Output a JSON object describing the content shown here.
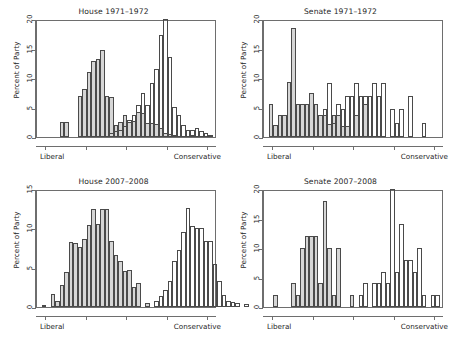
{
  "figure": {
    "background": "#ffffff",
    "dem_color": "#d6d6d6",
    "rep_color": "#ffffff",
    "border_color": "#4a4a4a",
    "axis_color": "#6e6e6e"
  },
  "axis_labels": {
    "y": "Percent of Party",
    "x_left": "Liberal",
    "x_right": "Conservative"
  },
  "chart_data": [
    {
      "id": "house-1971-1972",
      "type": "bar",
      "title": "House 1971–1972",
      "xlabel": "",
      "ylabel": "Percent of Party",
      "xlim": [
        0,
        40
      ],
      "ylim": [
        0,
        20
      ],
      "yticks": [
        0,
        5,
        10,
        15,
        20
      ],
      "ytick_labels": [
        "0",
        "5",
        "10",
        "15",
        "20"
      ],
      "xticks": [
        2,
        11,
        20,
        29,
        38
      ],
      "grid": false,
      "legend": "none",
      "note": "Overlapping histograms of ideology scores; gray = liberal party, white = conservative party",
      "series": [
        {
          "name": "Liberal party (gray)",
          "fill": "#d6d6d6",
          "bin_start": 5,
          "bin_width": 1,
          "values": [
            2.6,
            2.6,
            0,
            0,
            7.0,
            8.1,
            11.0,
            12.8,
            13.2,
            14.8,
            7.0,
            6.8,
            2.0,
            2.5,
            3.7,
            2.6,
            2.7,
            4.3,
            4.0,
            2.4,
            2.3,
            2.2,
            1.6,
            0.6,
            0.5,
            0.3,
            0,
            0,
            0,
            0.2
          ]
        },
        {
          "name": "Conservative party (white)",
          "fill": "#ffffff",
          "bin_start": 16,
          "bin_width": 1,
          "values": [
            0.6,
            1.0,
            1.2,
            1.9,
            2.9,
            3.8,
            5.4,
            7.4,
            5.4,
            9.2,
            11.6,
            17.3,
            20.0,
            13.6,
            5.1,
            3.8,
            2.0,
            1.2,
            1.2,
            1.5,
            1.1,
            0.7,
            0.3
          ]
        }
      ]
    },
    {
      "id": "senate-1971-1972",
      "type": "bar",
      "title": "Senate 1971–1972",
      "xlabel": "",
      "ylabel": "Percent of Party",
      "xlim": [
        0,
        40
      ],
      "ylim": [
        0,
        20
      ],
      "yticks": [
        0,
        5,
        10,
        15,
        20
      ],
      "ytick_labels": [
        "0",
        "5",
        "10",
        "15",
        "20"
      ],
      "xticks": [
        2,
        11,
        20,
        29,
        38
      ],
      "grid": false,
      "legend": "none",
      "note": "Overlapping histograms of ideology scores; gray = liberal party, white = conservative party",
      "series": [
        {
          "name": "Liberal party (gray)",
          "fill": "#d6d6d6",
          "bin_start": 1,
          "bin_width": 1,
          "values": [
            5.6,
            2.1,
            3.8,
            3.8,
            9.3,
            18.5,
            5.6,
            5.6,
            5.6,
            7.4,
            5.6,
            3.7,
            3.7,
            2.2,
            3.7,
            3.7,
            1.9,
            1.9,
            0,
            3.7,
            0,
            5.6,
            0,
            0,
            0,
            0,
            0,
            0,
            0,
            0
          ]
        },
        {
          "name": "Conservative party (white)",
          "fill": "#ffffff",
          "bin_start": 13,
          "bin_width": 1,
          "values": [
            4.7,
            9.1,
            2.3,
            5.6,
            4.7,
            6.9,
            6.9,
            9.1,
            6.9,
            6.9,
            6.9,
            9.1,
            6.9,
            9.1,
            0,
            4.7,
            2.3,
            4.7,
            0,
            6.9,
            0,
            0,
            2.3
          ]
        }
      ]
    },
    {
      "id": "house-2007-2008",
      "type": "bar",
      "title": "House 2007–2008",
      "xlabel": "",
      "ylabel": "Percent of Party",
      "xlim": [
        0,
        40
      ],
      "ylim": [
        0,
        15
      ],
      "yticks": [
        0,
        5,
        10,
        15
      ],
      "ytick_labels": [
        "0",
        "5",
        "10",
        "15"
      ],
      "xticks": [
        2,
        11,
        20,
        29,
        38
      ],
      "grid": false,
      "legend": "none",
      "note": "Two non-overlapping modes indicate strong polarization",
      "series": [
        {
          "name": "Liberal party (gray)",
          "fill": "#d6d6d6",
          "bin_start": 1,
          "bin_width": 1,
          "values": [
            0.3,
            0,
            1.7,
            0.8,
            2.8,
            4.4,
            8.3,
            8.1,
            7.6,
            8.6,
            10.4,
            12.4,
            10.5,
            12.4,
            12.4,
            8.4,
            6.6,
            5.8,
            4.6,
            4.7,
            2.6,
            3.0,
            0,
            0.5
          ]
        },
        {
          "name": "Conservative party (white)",
          "fill": "#ffffff",
          "bin_start": 26,
          "bin_width": 1,
          "values": [
            0.8,
            1.4,
            2.2,
            3.3,
            5.8,
            7.2,
            9.5,
            12.6,
            10.3,
            10.0,
            10.0,
            8.4,
            8.4,
            5.5,
            3.3,
            1.5,
            0.8,
            0.6,
            0.5,
            0,
            0.4
          ]
        }
      ]
    },
    {
      "id": "senate-2007-2008",
      "type": "bar",
      "title": "Senate 2007–2008",
      "xlabel": "",
      "ylabel": "Percent of Party",
      "xlim": [
        0,
        40
      ],
      "ylim": [
        0,
        20
      ],
      "yticks": [
        0,
        5,
        10,
        15,
        20
      ],
      "ytick_labels": [
        "0",
        "5",
        "10",
        "15",
        "20"
      ],
      "xticks": [
        2,
        11,
        20,
        29,
        38
      ],
      "grid": false,
      "legend": "none",
      "note": "Two non-overlapping modes indicate strong polarization",
      "series": [
        {
          "name": "Liberal party (gray)",
          "fill": "#d6d6d6",
          "bin_start": 2,
          "bin_width": 1,
          "values": [
            2.0,
            0,
            0,
            0,
            4.0,
            2.0,
            10.0,
            12.0,
            12.0,
            12.0,
            4.0,
            18.0,
            10.0,
            2.0,
            10.0,
            0,
            0,
            2.0
          ]
        },
        {
          "name": "Conservative party (white)",
          "fill": "#ffffff",
          "bin_start": 21,
          "bin_width": 1,
          "values": [
            2.0,
            4.0,
            0,
            4.0,
            4.0,
            6.0,
            4.0,
            20.0,
            6.0,
            14.0,
            8.0,
            8.0,
            6.0,
            10.0,
            2.0,
            0,
            2.0,
            2.0
          ]
        }
      ]
    }
  ]
}
